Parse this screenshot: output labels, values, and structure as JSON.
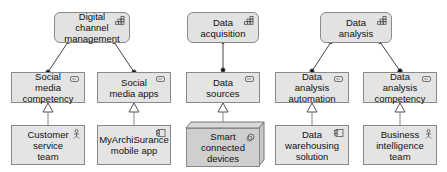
{
  "diagram": {
    "capabilities": [
      {
        "id": "dcm",
        "label": "Digital channel management",
        "icon": "capability-icon"
      },
      {
        "id": "daq",
        "label": "Data acquisition",
        "icon": "capability-icon"
      },
      {
        "id": "dan",
        "label": "Data analysis",
        "icon": "capability-icon"
      }
    ],
    "resources": [
      {
        "id": "smc",
        "label": "Social media competency",
        "icon": "resource-icon"
      },
      {
        "id": "sma",
        "label": "Social media apps",
        "icon": "resource-icon"
      },
      {
        "id": "ds",
        "label": "Data sources",
        "icon": "resource-icon"
      },
      {
        "id": "daa",
        "label": "Data analysis automation",
        "icon": "resource-icon"
      },
      {
        "id": "dac",
        "label": "Data analysis competency",
        "icon": "resource-icon"
      }
    ],
    "realizers": [
      {
        "id": "cst",
        "label": "Customer service team",
        "icon": "actor-icon"
      },
      {
        "id": "mas",
        "label": "MyArchiSurance mobile app",
        "icon": "application-component-icon"
      },
      {
        "id": "scd",
        "label": "Smart connected devices",
        "icon": "device-icon"
      },
      {
        "id": "dws",
        "label": "Data warehousing solution",
        "icon": "application-component-icon"
      },
      {
        "id": "bit",
        "label": "Business intelligence team",
        "icon": "actor-icon"
      }
    ],
    "relations": [
      {
        "from": "smc",
        "to": "dcm",
        "type": "association"
      },
      {
        "from": "sma",
        "to": "dcm",
        "type": "association"
      },
      {
        "from": "ds",
        "to": "daq",
        "type": "association"
      },
      {
        "from": "daa",
        "to": "dan",
        "type": "association"
      },
      {
        "from": "dac",
        "to": "dan",
        "type": "association"
      },
      {
        "from": "cst",
        "to": "smc",
        "type": "realization"
      },
      {
        "from": "mas",
        "to": "sma",
        "type": "realization"
      },
      {
        "from": "scd",
        "to": "ds",
        "type": "realization"
      },
      {
        "from": "dws",
        "to": "daa",
        "type": "realization"
      },
      {
        "from": "bit",
        "to": "dac",
        "type": "realization"
      }
    ]
  }
}
